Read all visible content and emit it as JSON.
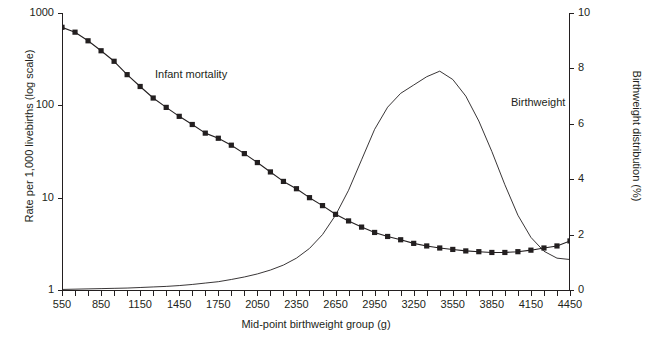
{
  "chart_data": {
    "type": "line",
    "title": "",
    "xlabel": "Mid-point birthweight group (g)",
    "ylabel": "Rate per 1,000 livebirths (log scale)",
    "y2label": "Birthweight distribution (%)",
    "xlim": [
      550,
      4450
    ],
    "xticks": [
      550,
      850,
      1150,
      1450,
      1750,
      2050,
      2350,
      2650,
      2950,
      3250,
      3550,
      3850,
      4150,
      4450
    ],
    "xtick_labels": [
      "550",
      "850",
      "1150",
      "1450",
      "1750",
      "2050",
      "2350",
      "2650",
      "2950",
      "3250",
      "3550",
      "3850",
      "4150",
      "4450"
    ],
    "x_minor_tick_step": 100,
    "yscale": "log",
    "ylim": [
      1,
      1000
    ],
    "yticks": [
      1,
      10,
      100,
      1000
    ],
    "ytick_labels": [
      "1",
      "10",
      "100",
      "1000"
    ],
    "y2lim": [
      0,
      10
    ],
    "y2ticks": [
      0,
      2,
      4,
      6,
      8,
      10
    ],
    "y2tick_labels": [
      "0",
      "2",
      "4",
      "6",
      "8",
      "10"
    ],
    "grid": false,
    "legend_position": "inline-annotations",
    "x": [
      550,
      650,
      750,
      850,
      950,
      1050,
      1150,
      1250,
      1350,
      1450,
      1550,
      1650,
      1750,
      1850,
      1950,
      2050,
      2150,
      2250,
      2350,
      2450,
      2550,
      2650,
      2750,
      2850,
      2950,
      3050,
      3150,
      3250,
      3350,
      3450,
      3550,
      3650,
      3750,
      3850,
      3950,
      4050,
      4150,
      4250,
      4350,
      4450
    ],
    "series": [
      {
        "name": "Infant mortality",
        "axis": "left",
        "marker": "square",
        "color": "#231f20",
        "annotation": "Infant mortality",
        "values": [
          700,
          620,
          500,
          390,
          300,
          215,
          160,
          120,
          95,
          76,
          62,
          50,
          44,
          37,
          30,
          24,
          19,
          15,
          12.5,
          10,
          8.2,
          6.6,
          5.6,
          4.8,
          4.2,
          3.8,
          3.5,
          3.2,
          3.0,
          2.85,
          2.75,
          2.65,
          2.6,
          2.55,
          2.55,
          2.6,
          2.7,
          2.85,
          3.0,
          3.4
        ]
      },
      {
        "name": "Birthweight distribution",
        "axis": "right",
        "marker": "none",
        "color": "#231f20",
        "annotation": "Birthweight",
        "values": [
          0.02,
          0.03,
          0.04,
          0.05,
          0.06,
          0.07,
          0.09,
          0.11,
          0.13,
          0.16,
          0.2,
          0.25,
          0.3,
          0.38,
          0.47,
          0.58,
          0.72,
          0.9,
          1.15,
          1.5,
          2.0,
          2.7,
          3.6,
          4.7,
          5.8,
          6.6,
          7.1,
          7.4,
          7.7,
          7.9,
          7.6,
          7.0,
          6.1,
          5.0,
          3.8,
          2.7,
          1.9,
          1.4,
          1.15,
          1.1
        ]
      }
    ]
  }
}
